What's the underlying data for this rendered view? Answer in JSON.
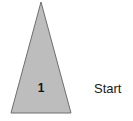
{
  "canvas": {
    "width": 133,
    "height": 121,
    "background_color": "#ffffff"
  },
  "diagram": {
    "shape": {
      "kind": "triangle",
      "name": "isosceles-triangle",
      "fill_color": "#bdbdbd",
      "stroke_color": "#6e6e6e",
      "stroke_width": 1,
      "points": "41,2 71,113 11,113",
      "apex_x": 41,
      "apex_y": 2,
      "base_left_x": 11,
      "base_right_x": 71,
      "base_y": 113
    },
    "number_label": "1",
    "caption_label": "Start",
    "number_color": "#141414",
    "caption_color": "#1a1a1a"
  }
}
